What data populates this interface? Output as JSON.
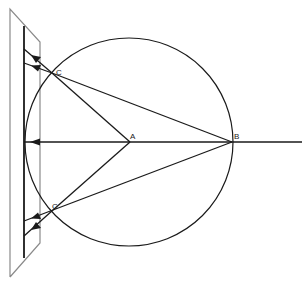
{
  "diagram": {
    "type": "geometric-optics-reflection",
    "labels": {
      "A": "A",
      "B": "B",
      "C_upper": "C",
      "C_lower": "C"
    },
    "points": {
      "A": [
        130,
        143
      ],
      "B": [
        232,
        143
      ],
      "C_upper": [
        52,
        73
      ],
      "C_lower": [
        53,
        210
      ]
    },
    "circle": {
      "cx": 129,
      "cy": 142,
      "r": 104
    },
    "mirror_x": 24,
    "colors": {
      "line": "#1a1a1a",
      "panel": "#8a8a8a",
      "background": "#ffffff"
    }
  }
}
